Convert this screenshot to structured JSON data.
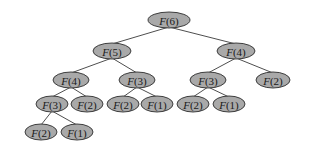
{
  "diagram": {
    "title": "",
    "type": "recursion-tree",
    "background": "#ffffff",
    "node_fill": "#a9a9a9",
    "node_stroke": "#2e2e2e",
    "edge_color": "#3a3a3a",
    "nodes": [
      {
        "id": "n0",
        "fn": "F",
        "arg": "(6)",
        "label": "F(6)",
        "cx": 169,
        "cy": 20,
        "rx": 21,
        "ry": 8
      },
      {
        "id": "n1",
        "fn": "F",
        "arg": "(5)",
        "label": "F(5)",
        "cx": 112,
        "cy": 51,
        "rx": 19,
        "ry": 8
      },
      {
        "id": "n2",
        "fn": "F",
        "arg": "(4)",
        "label": "F(4)",
        "cx": 236,
        "cy": 51,
        "rx": 19,
        "ry": 8
      },
      {
        "id": "n3",
        "fn": "F",
        "arg": "(4)",
        "label": "F(4)",
        "cx": 71,
        "cy": 80,
        "rx": 18,
        "ry": 8
      },
      {
        "id": "n4",
        "fn": "F",
        "arg": "(3)",
        "label": "F(3)",
        "cx": 137,
        "cy": 80,
        "rx": 18,
        "ry": 8
      },
      {
        "id": "n5",
        "fn": "F",
        "arg": "(3)",
        "label": "F(3)",
        "cx": 208,
        "cy": 80,
        "rx": 18,
        "ry": 8
      },
      {
        "id": "n6",
        "fn": "F",
        "arg": "(2)",
        "label": "F(2)",
        "cx": 273,
        "cy": 80,
        "rx": 17,
        "ry": 8
      },
      {
        "id": "n7",
        "fn": "F",
        "arg": "(3)",
        "label": "F(3)",
        "cx": 52,
        "cy": 104,
        "rx": 16,
        "ry": 8
      },
      {
        "id": "n8",
        "fn": "F",
        "arg": "(2)",
        "label": "F(2)",
        "cx": 87,
        "cy": 104,
        "rx": 16,
        "ry": 8
      },
      {
        "id": "n9",
        "fn": "F",
        "arg": "(2)",
        "label": "F(2)",
        "cx": 123,
        "cy": 104,
        "rx": 16,
        "ry": 8
      },
      {
        "id": "n10",
        "fn": "F",
        "arg": "(1)",
        "label": "F(1)",
        "cx": 157,
        "cy": 104,
        "rx": 16,
        "ry": 8
      },
      {
        "id": "n11",
        "fn": "F",
        "arg": "(2)",
        "label": "F(2)",
        "cx": 193,
        "cy": 104,
        "rx": 16,
        "ry": 8
      },
      {
        "id": "n12",
        "fn": "F",
        "arg": "(1)",
        "label": "F(1)",
        "cx": 229,
        "cy": 104,
        "rx": 16,
        "ry": 8
      },
      {
        "id": "n13",
        "fn": "F",
        "arg": "(2)",
        "label": "F(2)",
        "cx": 41,
        "cy": 132,
        "rx": 16,
        "ry": 8
      },
      {
        "id": "n14",
        "fn": "F",
        "arg": "(1)",
        "label": "F(1)",
        "cx": 77,
        "cy": 132,
        "rx": 16,
        "ry": 8
      }
    ],
    "edges": [
      {
        "from": "n0",
        "to": "n1"
      },
      {
        "from": "n0",
        "to": "n2"
      },
      {
        "from": "n1",
        "to": "n3"
      },
      {
        "from": "n1",
        "to": "n4"
      },
      {
        "from": "n2",
        "to": "n5"
      },
      {
        "from": "n2",
        "to": "n6"
      },
      {
        "from": "n3",
        "to": "n7"
      },
      {
        "from": "n3",
        "to": "n8"
      },
      {
        "from": "n4",
        "to": "n9"
      },
      {
        "from": "n4",
        "to": "n10"
      },
      {
        "from": "n5",
        "to": "n11"
      },
      {
        "from": "n5",
        "to": "n12"
      },
      {
        "from": "n7",
        "to": "n13"
      },
      {
        "from": "n7",
        "to": "n14"
      }
    ]
  }
}
